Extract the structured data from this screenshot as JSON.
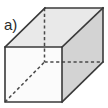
{
  "figure": {
    "label": "a)",
    "label_position": {
      "x": 4,
      "y": 17
    },
    "shape_name": "cuboid",
    "canvas": {
      "width": 108,
      "height": 108,
      "background": "#ffffff"
    },
    "colors": {
      "background": "#ffffff",
      "front_face_fill": "#fbfbfb",
      "top_face_fill": "#e9e9e9",
      "right_face_fill": "#d3d3d3",
      "visible_edge_stroke": "#3a3a3a",
      "hidden_edge_stroke": "#4a4a4a",
      "label_color": "#2b2b2b"
    },
    "vertices": {
      "front_top_left": {
        "x": 5,
        "y": 47
      },
      "front_top_right": {
        "x": 62,
        "y": 47
      },
      "front_bottom_right": {
        "x": 62,
        "y": 102
      },
      "front_bottom_left": {
        "x": 5,
        "y": 102
      },
      "back_top_left": {
        "x": 45,
        "y": 8
      },
      "back_top_right": {
        "x": 103,
        "y": 8
      },
      "back_bottom_right": {
        "x": 103,
        "y": 62
      },
      "back_bottom_left": {
        "x": 45,
        "y": 62
      }
    },
    "faces": [
      {
        "name": "top-face",
        "fill": "#e9e9e9",
        "points": "5,47 45,8 103,8 62,47"
      },
      {
        "name": "right-face",
        "fill": "#d3d3d3",
        "points": "62,47 103,8 103,62 62,102"
      },
      {
        "name": "front-face",
        "fill": "#fbfbfb",
        "points": "5,47 62,47 62,102 5,102"
      }
    ],
    "visible_edges": [
      {
        "name": "front-face-outline",
        "points": "5,47 62,47 62,102 5,102 5,47"
      },
      {
        "name": "top-left-receding-edge",
        "points": "5,47 45,8"
      },
      {
        "name": "back-top-edge",
        "points": "45,8 103,8"
      },
      {
        "name": "top-right-receding-edge",
        "points": "62,47 103,8"
      },
      {
        "name": "back-right-vertical-edge",
        "points": "103,8 103,62"
      },
      {
        "name": "bottom-right-receding-edge",
        "points": "103,62 62,102"
      }
    ],
    "hidden_edges": [
      {
        "name": "hidden-vertical-edge",
        "points": "44.5,8 44.5,62"
      },
      {
        "name": "hidden-back-bottom-edge",
        "points": "44.5,62 102,62"
      },
      {
        "name": "hidden-bottom-left-receding-edge",
        "points": "5,102 44.5,62"
      }
    ]
  }
}
